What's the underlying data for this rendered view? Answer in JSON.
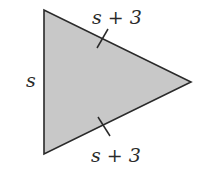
{
  "diagram": {
    "shape": "triangle",
    "fill_color": "#c8c8c8",
    "stroke_color": "#2a2a2a",
    "vertices": [
      [
        44,
        10
      ],
      [
        44,
        154
      ],
      [
        191,
        82
      ]
    ],
    "labels": {
      "left_side": "s",
      "top_side": "s + 3",
      "bottom_side": "s + 3"
    },
    "tick_marks": {
      "top_side": "congruent-tick",
      "bottom_side": "congruent-tick"
    }
  }
}
